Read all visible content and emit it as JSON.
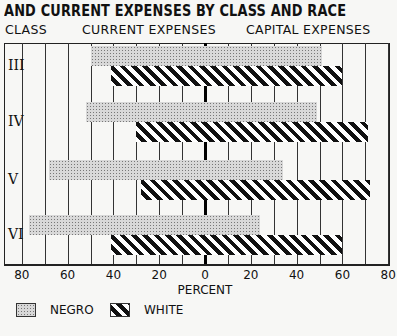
{
  "title": "AND CURRENT EXPENSES BY CLASS AND RACE",
  "headers": {
    "class": "CLASS",
    "current": "CURRENT EXPENSES",
    "capital": "CAPITAL EXPENSES"
  },
  "legend": {
    "negro": "NEGRO",
    "white": "WHITE"
  },
  "chart_data": {
    "type": "bar",
    "orientation": "horizontal-diverging",
    "title": "AND CURRENT EXPENSES BY CLASS AND RACE",
    "xlabel": "PERCENT",
    "ylabel": "CLASS",
    "left_panel_label": "CURRENT EXPENSES",
    "right_panel_label": "CAPITAL EXPENSES",
    "categories": [
      "III",
      "IV",
      "V",
      "VI"
    ],
    "x_ticks": [
      "80",
      "60",
      "40",
      "20",
      "0",
      "20",
      "40",
      "60",
      "80"
    ],
    "xlim": [
      -80,
      80
    ],
    "grid": true,
    "grid_step": 10,
    "legend_position": "bottom-left",
    "series": [
      {
        "name": "NEGRO",
        "current_expenses": [
          50,
          52,
          68,
          77
        ],
        "capital_expenses": [
          51,
          49,
          34,
          24
        ]
      },
      {
        "name": "WHITE",
        "current_expenses": [
          41,
          30,
          28,
          41
        ],
        "capital_expenses": [
          60,
          71,
          72,
          60
        ]
      }
    ]
  }
}
